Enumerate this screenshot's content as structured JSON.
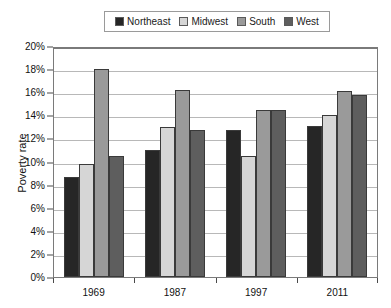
{
  "chart_data": {
    "type": "bar",
    "title": "",
    "subtitle": "",
    "xlabel": "",
    "ylabel": "Poverty rate",
    "categories": [
      "1969",
      "1987",
      "1997",
      "2011"
    ],
    "series": [
      {
        "name": "Northeast",
        "color": "#262626",
        "values": [
          8.7,
          11.0,
          12.7,
          13.1
        ]
      },
      {
        "name": "Midwest",
        "color": "#d6d6d6",
        "values": [
          9.8,
          13.0,
          10.5,
          14.0
        ]
      },
      {
        "name": "South",
        "color": "#9a9a9a",
        "values": [
          18.0,
          16.2,
          14.5,
          16.1
        ]
      },
      {
        "name": "West",
        "color": "#5e5e5e",
        "values": [
          10.5,
          12.7,
          14.5,
          15.8
        ]
      }
    ],
    "ylim": [
      0,
      20
    ],
    "ytick_step": 2,
    "ytick_labels": [
      "0%",
      "2%",
      "4%",
      "6%",
      "8%",
      "10%",
      "12%",
      "14%",
      "16%",
      "18%",
      "20%"
    ],
    "grid": "horizontal",
    "legend_position": "top-center",
    "value_suffix": "%"
  },
  "legend": {
    "items": [
      {
        "label": "Northeast"
      },
      {
        "label": "Midwest"
      },
      {
        "label": "South"
      },
      {
        "label": "West"
      }
    ]
  },
  "axes": {
    "y_label": "Poverty rate"
  }
}
